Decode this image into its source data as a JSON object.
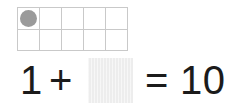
{
  "worksheet": {
    "label": "ten-frame addition worksheet",
    "background_color": "#ffffff"
  },
  "ten_frame": {
    "label": "ten frame",
    "columns": 5,
    "rows": 2,
    "total_cells": 10,
    "filled_count": 1,
    "line_color": "#c9c9c9",
    "counter_color": "#9a9a9a",
    "cells": [
      {
        "index": 1,
        "filled": true,
        "counter": "gray-circle-counter"
      },
      {
        "index": 2,
        "filled": false,
        "counter": ""
      },
      {
        "index": 3,
        "filled": false,
        "counter": ""
      },
      {
        "index": 4,
        "filled": false,
        "counter": ""
      },
      {
        "index": 5,
        "filled": false,
        "counter": ""
      },
      {
        "index": 6,
        "filled": false,
        "counter": ""
      },
      {
        "index": 7,
        "filled": false,
        "counter": ""
      },
      {
        "index": 8,
        "filled": false,
        "counter": ""
      },
      {
        "index": 9,
        "filled": false,
        "counter": ""
      },
      {
        "index": 10,
        "filled": false,
        "counter": ""
      }
    ]
  },
  "equation": {
    "label": "1 + ? = 10",
    "text_color": "#1b1b1b",
    "addend_one": "1",
    "plus_sign": "+",
    "blank_answer": {
      "value": "",
      "placeholder": "",
      "fill_color": "#ededed",
      "state": "blank"
    },
    "equals_sign": "=",
    "sum": "10"
  }
}
